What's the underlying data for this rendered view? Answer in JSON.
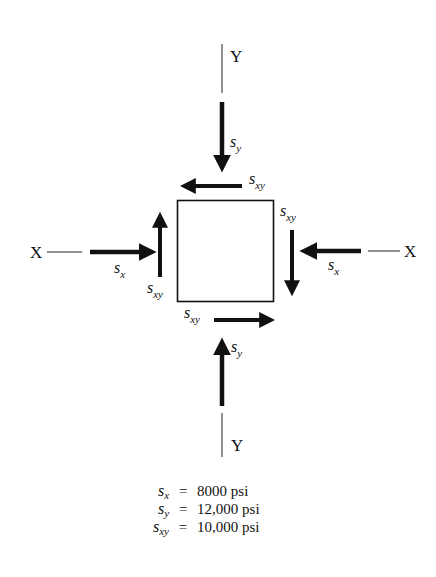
{
  "diagram": {
    "type": "stress-element",
    "axes": {
      "x_left_label": "X",
      "x_right_label": "X",
      "y_top_label": "Y",
      "y_bottom_label": "Y"
    },
    "arrow_labels": {
      "sy_top": {
        "sym": "s",
        "sub": "y"
      },
      "sxy_top": {
        "sym": "s",
        "sub": "xy"
      },
      "sxy_right": {
        "sym": "s",
        "sub": "xy"
      },
      "sx_right": {
        "sym": "s",
        "sub": "x"
      },
      "sx_left": {
        "sym": "s",
        "sub": "x"
      },
      "sxy_left": {
        "sym": "s",
        "sub": "xy"
      },
      "sxy_bottom": {
        "sym": "s",
        "sub": "xy"
      },
      "sy_bottom": {
        "sym": "s",
        "sub": "y"
      }
    },
    "colors": {
      "ink": "#111111",
      "background": "#ffffff"
    }
  },
  "legend": [
    {
      "sym": "s",
      "sub": "x",
      "eq": "=",
      "value": "8000 psi"
    },
    {
      "sym": "s",
      "sub": "y",
      "eq": "=",
      "value": "12,000 psi"
    },
    {
      "sym": "s",
      "sub": "xy",
      "eq": "=",
      "value": "10,000 psi"
    }
  ]
}
